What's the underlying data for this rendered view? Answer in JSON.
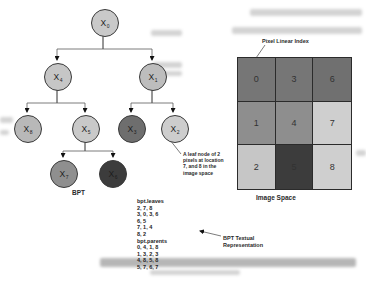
{
  "labels": {
    "pixel_linear_index": "Pixel Linear Index",
    "bpt": "BPT",
    "image_space": "Image Space",
    "leaf_annotation": "A leaf node of 2\npixels at location\n7, and 8 in the\nimage space",
    "textual_representation": "BPT Textual\nRepresentation"
  },
  "tree": {
    "nodes": [
      {
        "label": "X",
        "sub": "0",
        "color": "#c9c9c9"
      },
      {
        "label": "X",
        "sub": "4",
        "color": "#c6c6c6"
      },
      {
        "label": "X",
        "sub": "1",
        "color": "#bdbdbd"
      },
      {
        "label": "X",
        "sub": "8",
        "color": "#b8b8b8"
      },
      {
        "label": "X",
        "sub": "5",
        "color": "#c9c9c9"
      },
      {
        "label": "X",
        "sub": "3",
        "color": "#6e6e6e"
      },
      {
        "label": "X",
        "sub": "2",
        "color": "#cdcdcd"
      },
      {
        "label": "X",
        "sub": "7",
        "color": "#8f8f8f"
      },
      {
        "label": "X",
        "sub": "6",
        "color": "#3c3c3c"
      }
    ]
  },
  "grid": {
    "cells": [
      {
        "label": "0",
        "color": "#767676"
      },
      {
        "label": "3",
        "color": "#767676"
      },
      {
        "label": "6",
        "color": "#707070"
      },
      {
        "label": "1",
        "color": "#8e8e8e"
      },
      {
        "label": "4",
        "color": "#8e8e8e"
      },
      {
        "label": "7",
        "color": "#cfcfcf"
      },
      {
        "label": "2",
        "color": "#c6c6c6"
      },
      {
        "label": "5",
        "color": "#3c3c3c"
      },
      {
        "label": "8",
        "color": "#cfcfcf"
      }
    ]
  },
  "textual": {
    "lines": [
      "bpt.leaves",
      "2, 7, 8",
      "3, 0, 3, 6",
      "6, 5",
      "7, 1, 4",
      "8, 2",
      "bpt.parents",
      "0, 4, 1, 8",
      "1, 3, 2, 3",
      "4, 8, 5, 8",
      "5, 7, 6, 7"
    ]
  }
}
